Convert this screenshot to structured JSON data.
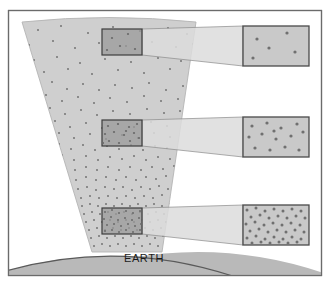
{
  "figure": {
    "title_text": "EARTH",
    "frame": {
      "x": 8,
      "y": 10,
      "width": 314,
      "height": 266,
      "stroke": "#6b6b6b",
      "fill": "#ffffff"
    },
    "colors": {
      "background": "#ffffff",
      "frame_stroke": "#6b6b6b",
      "cone_fill": "#cfcfcf",
      "cone_stroke": "#b4b4b4",
      "earth_fill": "#b9b9b9",
      "earth_stroke": "#5a5a5a",
      "dot_color": "#7a7a7a",
      "sample_box_fill": "#9a9a9a",
      "sample_box_stroke": "#3d3d3d",
      "funnel_fill": "#dcdcdc",
      "funnel_stroke": "#8a8a8a",
      "inset_fill": "#c9c9c9",
      "inset_stroke": "#4a4a4a",
      "label_color": "#1b1b1b"
    },
    "cone": {
      "description": "diverging beam widening upward from Earth surface",
      "top_left_x": 22,
      "top_right_x": 196,
      "top_y": 22,
      "bottom_left_x": 92,
      "bottom_right_x": 162,
      "bottom_y": 252,
      "top_arc_sagitta": 9
    },
    "earth": {
      "label": "EARTH",
      "label_x": 124,
      "label_y": 262,
      "arc_left_x": 12,
      "arc_right_x": 244,
      "arc_top_y": 238,
      "base_y": 274
    },
    "samples": [
      {
        "id": "top",
        "label": "low-density sample",
        "box": {
          "x": 102,
          "y": 29,
          "width": 40,
          "height": 26
        },
        "dot_count": 5,
        "density": "sparse",
        "inset": {
          "x": 243,
          "y": 26,
          "width": 66,
          "height": 40
        },
        "inset_dot_count": 5
      },
      {
        "id": "middle",
        "label": "medium-density sample",
        "box": {
          "x": 102,
          "y": 120,
          "width": 40,
          "height": 26
        },
        "dot_count": 14,
        "density": "medium",
        "inset": {
          "x": 243,
          "y": 117,
          "width": 66,
          "height": 40
        },
        "inset_dot_count": 14
      },
      {
        "id": "bottom",
        "label": "high-density sample",
        "box": {
          "x": 102,
          "y": 208,
          "width": 40,
          "height": 26
        },
        "dot_count": 70,
        "density": "dense",
        "inset": {
          "x": 243,
          "y": 205,
          "width": 66,
          "height": 40
        },
        "inset_dot_count": 70
      }
    ],
    "dot_field": {
      "description": "particle density increases toward the Earth surface",
      "gradient": "sparse at top, dense at bottom",
      "dot_radius": 1.1
    }
  }
}
